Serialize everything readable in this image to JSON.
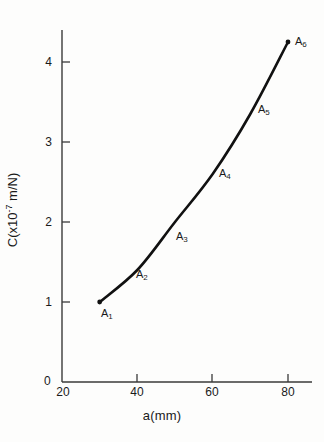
{
  "chart_data": {
    "type": "line",
    "title": "",
    "subtitle": "",
    "xlabel": "a(mm)",
    "ylabel": "C(x10-7 m/N)",
    "ylabel_prefix": "C(x10",
    "ylabel_exponent": "-7",
    "ylabel_suffix": " m/N)",
    "xlim": [
      20,
      86
    ],
    "ylim": [
      0,
      4.4
    ],
    "grid": false,
    "legend": null,
    "x_ticks": [
      "20",
      "40",
      "60",
      "80"
    ],
    "x_tick_values": [
      20,
      40,
      60,
      80
    ],
    "y_ticks": [
      "1",
      "2",
      "3",
      "4"
    ],
    "y_tick_values": [
      1,
      2,
      3,
      4
    ],
    "y_origin_label": "0",
    "x": [
      30,
      40,
      50,
      60,
      70,
      80
    ],
    "values": [
      1.0,
      1.4,
      2.0,
      2.6,
      3.35,
      4.25
    ],
    "point_labels": [
      "A1",
      "A2",
      "A3",
      "A4",
      "A5",
      "A6"
    ],
    "points": [
      {
        "label_base": "A",
        "label_sub": "1",
        "x": 30,
        "y": 1.0,
        "marker": true
      },
      {
        "label_base": "A",
        "label_sub": "2",
        "x": 40,
        "y": 1.4,
        "marker": false
      },
      {
        "label_base": "A",
        "label_sub": "3",
        "x": 50,
        "y": 2.0,
        "marker": false
      },
      {
        "label_base": "A",
        "label_sub": "4",
        "x": 60,
        "y": 2.6,
        "marker": false
      },
      {
        "label_base": "A",
        "label_sub": "5",
        "x": 70,
        "y": 3.35,
        "marker": false
      },
      {
        "label_base": "A",
        "label_sub": "6",
        "x": 80,
        "y": 4.25,
        "marker": true
      }
    ],
    "line_color": "#111111",
    "axis_color": "#3a3a3a",
    "background_color": "#fdfdfc"
  }
}
